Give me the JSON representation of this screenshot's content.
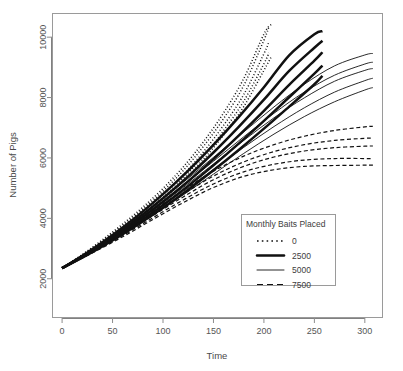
{
  "chart_data": {
    "type": "line",
    "title": "",
    "xlabel": "Time",
    "ylabel": "Number of Pigs",
    "xlim": [
      -10,
      318
    ],
    "ylim": [
      700,
      10800
    ],
    "xticks": [
      0,
      50,
      100,
      150,
      200,
      250,
      300
    ],
    "xtick_labels": [
      "0",
      "50",
      "100",
      "150",
      "200",
      "250",
      "300"
    ],
    "yticks": [
      2000,
      4000,
      6000,
      8000,
      10000
    ],
    "ytick_labels": [
      "2000",
      "4000",
      "6000",
      "8000",
      "10000"
    ],
    "grid": false,
    "legend_position": "center-right-lower",
    "legend_title": "Monthly Baits Placed",
    "legend_entries": [
      {
        "label": "0",
        "style": "dotted",
        "width": 1.6
      },
      {
        "label": "2500",
        "style": "solid-thick",
        "width": 2.6
      },
      {
        "label": "5000",
        "style": "solid-thin",
        "width": 1.0
      },
      {
        "label": "7500",
        "style": "dashed",
        "width": 1.2
      }
    ],
    "common_origin": {
      "x": 0,
      "y": 2350
    },
    "series": [
      {
        "name": "0",
        "style": "dotted",
        "x": [
          0,
          20,
          40,
          60,
          80,
          100,
          120,
          140,
          160,
          180,
          200,
          205
        ],
        "values": [
          2350,
          2790,
          3260,
          3760,
          4300,
          4900,
          5580,
          6380,
          7300,
          8400,
          9900,
          10350
        ]
      },
      {
        "name": "0",
        "style": "dotted",
        "x": [
          0,
          20,
          40,
          60,
          80,
          100,
          120,
          140,
          160,
          180,
          200,
          205
        ],
        "values": [
          2350,
          2770,
          3220,
          3700,
          4220,
          4790,
          5440,
          6200,
          7080,
          8100,
          9450,
          9850
        ]
      },
      {
        "name": "0",
        "style": "dotted",
        "x": [
          0,
          20,
          40,
          60,
          80,
          100,
          120,
          140,
          160,
          180,
          200,
          205
        ],
        "values": [
          2350,
          2755,
          3190,
          3650,
          4150,
          4700,
          5330,
          6060,
          6900,
          7880,
          9120,
          9480
        ]
      },
      {
        "name": "0",
        "style": "dotted",
        "x": [
          0,
          20,
          40,
          60,
          80,
          100,
          120,
          140,
          160,
          180,
          200,
          207
        ],
        "values": [
          2350,
          2745,
          3165,
          3610,
          4095,
          4630,
          5240,
          5950,
          6760,
          7700,
          8900,
          9330
        ]
      },
      {
        "name": "0",
        "style": "dotted",
        "x": [
          0,
          20,
          40,
          60,
          80,
          100,
          120,
          140,
          160,
          180,
          200,
          207
        ],
        "values": [
          2350,
          2800,
          3290,
          3810,
          4370,
          4990,
          5700,
          6530,
          7490,
          8630,
          10100,
          10420
        ]
      },
      {
        "name": "2500",
        "style": "solid-thick",
        "x": [
          0,
          25,
          50,
          75,
          100,
          125,
          150,
          175,
          200,
          225,
          250,
          258
        ],
        "values": [
          2350,
          2870,
          3450,
          4090,
          4800,
          5580,
          6430,
          7350,
          8340,
          9400,
          10100,
          10200
        ]
      },
      {
        "name": "2500",
        "style": "solid-thick",
        "x": [
          0,
          25,
          50,
          75,
          100,
          125,
          150,
          175,
          200,
          225,
          250,
          258
        ],
        "values": [
          2350,
          2845,
          3395,
          4000,
          4665,
          5390,
          6180,
          7030,
          7930,
          8880,
          9650,
          9880
        ]
      },
      {
        "name": "2500",
        "style": "solid-thick",
        "x": [
          0,
          25,
          50,
          75,
          100,
          125,
          150,
          175,
          200,
          225,
          250,
          258
        ],
        "values": [
          2350,
          2825,
          3350,
          3925,
          4550,
          5230,
          5960,
          6740,
          7560,
          8420,
          9220,
          9500
        ]
      },
      {
        "name": "2500",
        "style": "solid-thick",
        "x": [
          0,
          25,
          50,
          75,
          100,
          125,
          150,
          175,
          200,
          225,
          250,
          258
        ],
        "values": [
          2350,
          2805,
          3305,
          3850,
          4440,
          5075,
          5755,
          6475,
          7230,
          8010,
          8790,
          9060
        ]
      },
      {
        "name": "2500",
        "style": "solid-thick",
        "x": [
          0,
          25,
          50,
          75,
          100,
          125,
          150,
          175,
          200,
          225,
          250,
          258
        ],
        "values": [
          2350,
          2790,
          3270,
          3790,
          4350,
          4950,
          5590,
          6265,
          6970,
          7700,
          8440,
          8720
        ]
      },
      {
        "name": "5000",
        "style": "solid-thin",
        "x": [
          0,
          30,
          60,
          90,
          120,
          150,
          180,
          210,
          240,
          270,
          300,
          308
        ],
        "values": [
          2350,
          2960,
          3640,
          4390,
          5190,
          6020,
          6860,
          7690,
          8440,
          9050,
          9410,
          9460
        ]
      },
      {
        "name": "5000",
        "style": "solid-thin",
        "x": [
          0,
          30,
          60,
          90,
          120,
          150,
          180,
          210,
          240,
          270,
          300,
          308
        ],
        "values": [
          2350,
          2930,
          3570,
          4270,
          5020,
          5800,
          6580,
          7330,
          7990,
          8540,
          8900,
          8960
        ]
      },
      {
        "name": "5000",
        "style": "solid-thin",
        "x": [
          0,
          30,
          60,
          90,
          120,
          150,
          180,
          210,
          240,
          270,
          300,
          308
        ],
        "values": [
          2350,
          2905,
          3520,
          4180,
          4890,
          5620,
          6350,
          7040,
          7660,
          8180,
          8560,
          8640
        ]
      },
      {
        "name": "5000",
        "style": "solid-thin",
        "x": [
          0,
          30,
          60,
          90,
          120,
          150,
          180,
          210,
          240,
          270,
          300,
          308
        ],
        "values": [
          2350,
          2885,
          3470,
          4100,
          4775,
          5465,
          6150,
          6790,
          7370,
          7860,
          8250,
          8330
        ]
      },
      {
        "name": "5000",
        "style": "solid-thin",
        "x": [
          0,
          30,
          60,
          90,
          120,
          150,
          180,
          210,
          240,
          270,
          300,
          308
        ],
        "values": [
          2350,
          2945,
          3600,
          4320,
          5090,
          5890,
          6700,
          7480,
          8180,
          8740,
          9110,
          9170
        ]
      },
      {
        "name": "7500",
        "style": "dashed",
        "x": [
          0,
          30,
          60,
          90,
          120,
          150,
          180,
          210,
          240,
          270,
          300,
          308
        ],
        "values": [
          2350,
          2930,
          3560,
          4240,
          4930,
          5560,
          6060,
          6440,
          6720,
          6910,
          7030,
          7050
        ]
      },
      {
        "name": "7500",
        "style": "dashed",
        "x": [
          0,
          30,
          60,
          90,
          120,
          150,
          180,
          210,
          240,
          270,
          300,
          308
        ],
        "values": [
          2350,
          2905,
          3510,
          4155,
          4805,
          5400,
          5870,
          6210,
          6440,
          6580,
          6650,
          6660
        ]
      },
      {
        "name": "7500",
        "style": "dashed",
        "x": [
          0,
          30,
          60,
          90,
          120,
          150,
          180,
          210,
          240,
          270,
          300,
          308
        ],
        "values": [
          2350,
          2890,
          3470,
          4090,
          4710,
          5280,
          5720,
          6030,
          6230,
          6340,
          6390,
          6395
        ]
      },
      {
        "name": "7500",
        "style": "dashed",
        "x": [
          0,
          30,
          60,
          90,
          120,
          150,
          180,
          210,
          240,
          270,
          300,
          308
        ],
        "values": [
          2350,
          2870,
          3430,
          4020,
          4610,
          5140,
          5540,
          5790,
          5930,
          5980,
          5980,
          5975
        ]
      },
      {
        "name": "7500",
        "style": "dashed",
        "x": [
          0,
          30,
          60,
          90,
          120,
          150,
          180,
          210,
          240,
          270,
          300,
          308
        ],
        "values": [
          2350,
          2855,
          3390,
          3960,
          4520,
          5020,
          5390,
          5610,
          5720,
          5750,
          5760,
          5760
        ]
      }
    ]
  },
  "figure": {
    "plot_box": {
      "left": 52,
      "top": 13,
      "right": 383,
      "bottom": 318
    },
    "legend_box": {
      "left": 241,
      "top": 214,
      "right": 335,
      "bottom": 285
    }
  }
}
